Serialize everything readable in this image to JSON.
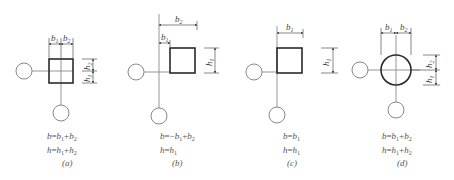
{
  "figure": {
    "panels": [
      {
        "id": "a",
        "caption": "(a)",
        "shape": "square",
        "dimensions": {
          "top": [
            "b1",
            "b2"
          ],
          "right": [
            "h2",
            "h1"
          ]
        },
        "formula_b": "b=b1+b2",
        "formula_h": "h=h1+h2"
      },
      {
        "id": "b",
        "caption": "(b)",
        "shape": "square",
        "dimensions": {
          "top": [
            "b2",
            "b1"
          ],
          "right": [
            "h1"
          ]
        },
        "formula_b": "b=−b1+b2",
        "formula_h": "h=h1"
      },
      {
        "id": "c",
        "caption": "(c)",
        "shape": "square",
        "dimensions": {
          "top": [
            "b1"
          ],
          "right": [
            "h1"
          ]
        },
        "formula_b": "b=b1",
        "formula_h": "h=h1"
      },
      {
        "id": "d",
        "caption": "(d)",
        "shape": "circle",
        "dimensions": {
          "top": [
            "b1",
            "b2"
          ],
          "right": [
            "h2",
            "h1"
          ]
        },
        "formula_b": "b=b1+b2",
        "formula_h": "h=h1+h2"
      }
    ],
    "labels": {
      "b": "b",
      "h": "h",
      "s1": "1",
      "s2": "2"
    },
    "colors": {
      "line": "#8a8a8a",
      "shape": "#2a2a2a",
      "text": "#555555"
    }
  }
}
